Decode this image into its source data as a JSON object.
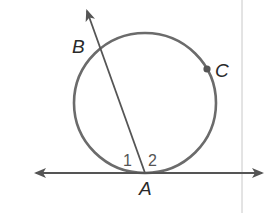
{
  "diagram": {
    "type": "circle-tangent-secant",
    "colors": {
      "circle": "#6b6b6b",
      "lines": "#555555",
      "point": "#555555",
      "text": "#2a2a2a",
      "margin_rule": "#c8c8c8"
    },
    "circle": {
      "cx": 145,
      "cy": 103,
      "rx": 71,
      "ry": 70
    },
    "points": [
      {
        "name": "A",
        "label": "A",
        "x": 145,
        "y": 173
      },
      {
        "name": "B",
        "label": "B",
        "x": 98,
        "y": 48
      },
      {
        "name": "C",
        "label": "C",
        "x": 207,
        "y": 69
      }
    ],
    "angles": [
      {
        "label": "1"
      },
      {
        "label": "2"
      }
    ],
    "tangent_line": {
      "through": "A",
      "direction": "horizontal"
    },
    "secant_ray": {
      "from": "A",
      "through": "B"
    }
  }
}
